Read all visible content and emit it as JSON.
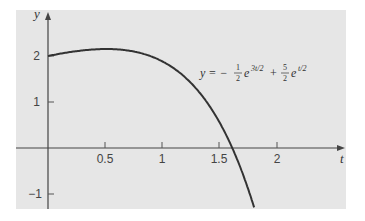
{
  "chart_data": {
    "type": "line",
    "title": "",
    "xlabel": "t",
    "ylabel": "y",
    "xlim": [
      -0.28,
      2.62
    ],
    "ylim": [
      -1.32,
      2.98
    ],
    "grid": false,
    "background": "#e6e6e6",
    "curve_color": "#333333",
    "x_ticks": [
      0.5,
      1,
      1.5,
      2
    ],
    "x_tick_labels": [
      "0.5",
      "1",
      "1.5",
      "2"
    ],
    "y_ticks": [
      -1,
      1,
      2
    ],
    "y_tick_labels": [
      "−1",
      "1",
      "2"
    ],
    "series": [
      {
        "name": "y = −(1/2)e^{3t/2} + (5/2)e^{t/2}",
        "formula": "-0.5*exp(1.5*t) + 2.5*exp(0.5*t)",
        "x": [
          0,
          0.1,
          0.2,
          0.3,
          0.4,
          0.5,
          0.6,
          0.7,
          0.8,
          0.9,
          1.0,
          1.1,
          1.2,
          1.3,
          1.4,
          1.5,
          1.6,
          1.7,
          1.8
        ],
        "y": [
          2.0,
          2.05,
          2.09,
          2.13,
          2.15,
          2.17,
          2.17,
          2.16,
          2.13,
          2.07,
          1.88,
          1.65,
          1.35,
          0.97,
          0.51,
          -0.08,
          -0.02,
          -0.65,
          -1.38
        ]
      }
    ],
    "annotation": {
      "text": "y = −½e^{3t/2} + (5/2)e^{t/2}",
      "position": {
        "t": 1.1,
        "y": 1.78
      }
    }
  },
  "labels": {
    "x_axis": "t",
    "y_axis": "y",
    "eq_lhs": "y = −",
    "eq_frac1_num": "1",
    "eq_frac1_den": "2",
    "eq_e1": "e",
    "eq_exp1": "3t/2",
    "eq_plus": "+",
    "eq_frac2_num": "5",
    "eq_frac2_den": "2",
    "eq_e2": "e",
    "eq_exp2": "t/2",
    "xt": [
      "0.5",
      "1",
      "1.5",
      "2"
    ],
    "yt": [
      "2",
      "1",
      "−1"
    ]
  }
}
